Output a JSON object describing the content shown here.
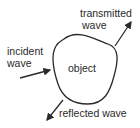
{
  "diagram": {
    "object_label": "object",
    "incident": {
      "line1": "incident",
      "line2": "wave"
    },
    "transmitted": {
      "line1": "transmitted",
      "line2": "wave"
    },
    "reflected": {
      "label": "reflected wave"
    },
    "colors": {
      "stroke": "#2a2a2a",
      "background": "#ffffff"
    }
  }
}
